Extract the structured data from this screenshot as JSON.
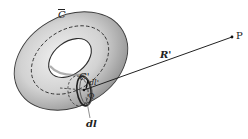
{
  "diagram": {
    "labels": {
      "curve_outer": "C",
      "curve_outer_overline": true,
      "curve_inner": "C'",
      "dl_prime": "dl'",
      "point_q": "Q",
      "dl": "dl",
      "vector_r": "R'",
      "point_p": "P"
    },
    "colors": {
      "torus_fill_light": "#e4e4e4",
      "torus_fill_dark": "#9a9a9a",
      "outline": "#3a3a3a",
      "line": "#222222",
      "background": "#ffffff"
    },
    "points": {
      "Q": [
        84,
        90
      ],
      "P": [
        232,
        37
      ]
    }
  }
}
